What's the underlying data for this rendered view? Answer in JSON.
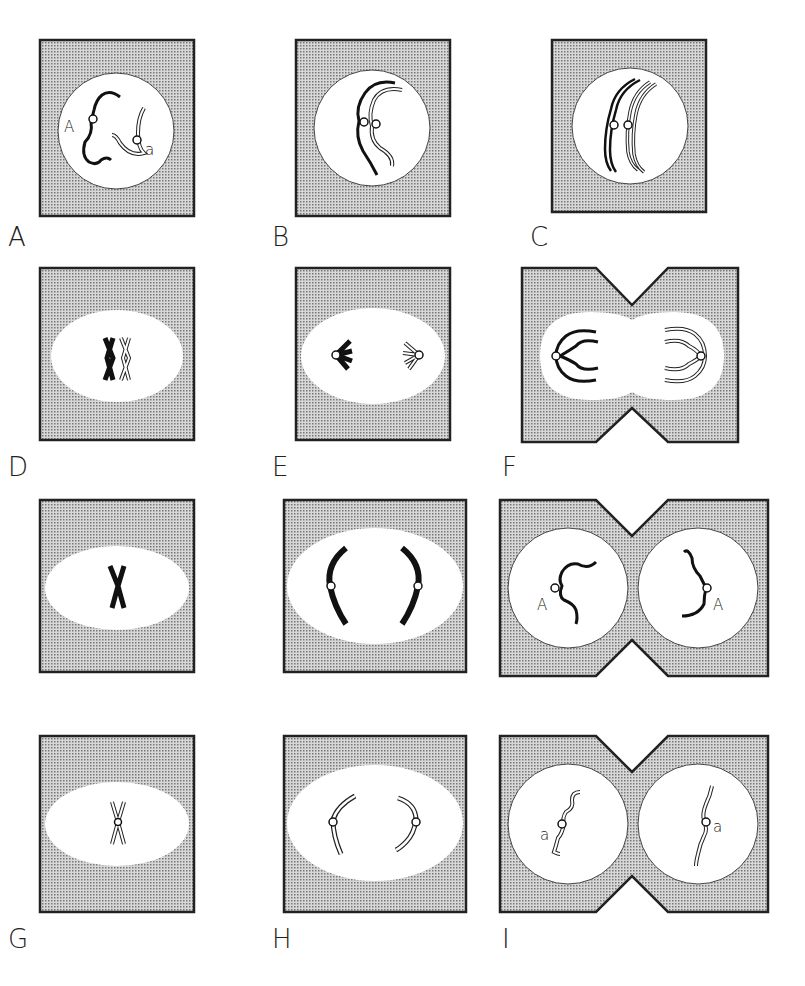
{
  "figure": {
    "panels": [
      {
        "id": "A",
        "label": "A",
        "stage": "prophase",
        "inner_labels": [
          "A",
          "a"
        ]
      },
      {
        "id": "B",
        "label": "B",
        "stage": "pairing"
      },
      {
        "id": "C",
        "label": "C",
        "stage": "tetrad"
      },
      {
        "id": "D",
        "label": "D",
        "stage": "metaphase I"
      },
      {
        "id": "E",
        "label": "E",
        "stage": "anaphase I"
      },
      {
        "id": "F",
        "label": "F",
        "stage": "telophase I"
      },
      {
        "id": "G",
        "label": "G",
        "stage": "metaphase II"
      },
      {
        "id": "H",
        "label": "H",
        "stage": "anaphase II"
      },
      {
        "id": "I",
        "label": "I",
        "stage": "telophase II",
        "inner_labels": [
          "A",
          "A"
        ]
      },
      {
        "id": "J",
        "label": "",
        "stage": "metaphase II"
      },
      {
        "id": "K",
        "label": "",
        "stage": "anaphase II"
      },
      {
        "id": "L",
        "label": "",
        "stage": "telophase II",
        "inner_labels": [
          "a",
          "a"
        ]
      }
    ],
    "row_labels": [
      "A",
      "B",
      "C",
      "D",
      "E",
      "F",
      "G",
      "H",
      "I"
    ],
    "colors": {
      "stipple": "#9a9a9a",
      "outline": "#222222",
      "background": "#ffffff"
    }
  }
}
